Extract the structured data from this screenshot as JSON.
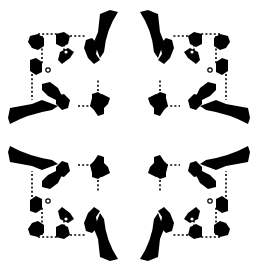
{
  "diagram": {
    "type": "architectural-floor-plan",
    "colors": {
      "background": "#ffffff",
      "ink": "#000000"
    },
    "center": [
      129,
      135
    ],
    "arms": [
      "north",
      "east",
      "south",
      "west"
    ],
    "corner_chapels": [
      "north-west",
      "north-east",
      "south-east",
      "south-west"
    ],
    "crossing_piers": 4,
    "text_labels": []
  }
}
